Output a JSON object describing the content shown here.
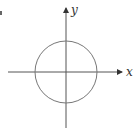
{
  "diagram": {
    "type": "coordinate-plane-with-circle",
    "axes": {
      "x_label": "x",
      "y_label": "y",
      "color": "#555555"
    },
    "circle": {
      "center_px": [
        66,
        72
      ],
      "radius_px": 31,
      "stroke": "#777777"
    },
    "corner_mark": "."
  }
}
